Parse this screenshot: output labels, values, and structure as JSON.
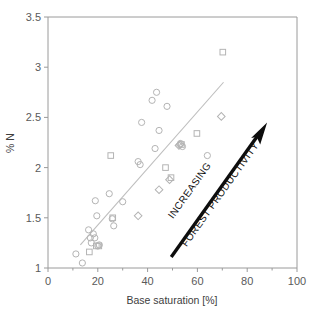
{
  "chart_data": {
    "type": "scatter",
    "title": "",
    "xlabel": "Base saturation [%]",
    "ylabel": "% N",
    "xlim": [
      0,
      100
    ],
    "ylim": [
      1,
      3.5
    ],
    "xticks": [
      0,
      20,
      40,
      60,
      80,
      100
    ],
    "xtick_labels": [
      "0",
      "20",
      "40",
      "60",
      "80",
      "100"
    ],
    "xminor_ticks": [
      10,
      30,
      50,
      70,
      90
    ],
    "yticks": [
      1,
      1.5,
      2,
      2.5,
      3,
      3.5
    ],
    "ytick_labels": [
      "1",
      "1.5",
      "2",
      "2.5",
      "3",
      "3.5"
    ],
    "grid": false,
    "legend": "none",
    "series": [
      {
        "name": "circles",
        "marker": "circle",
        "color": "#b4b4b4",
        "points": [
          [
            11.2,
            1.14
          ],
          [
            13.8,
            1.05
          ],
          [
            16.3,
            1.38
          ],
          [
            17.0,
            1.3
          ],
          [
            17.4,
            1.25
          ],
          [
            18.2,
            1.34
          ],
          [
            18.8,
            1.3
          ],
          [
            19.0,
            1.67
          ],
          [
            19.6,
            1.52
          ],
          [
            20.0,
            1.22
          ],
          [
            20.6,
            1.23
          ],
          [
            24.6,
            1.74
          ],
          [
            25.8,
            1.49
          ],
          [
            26.4,
            1.42
          ],
          [
            30.0,
            1.66
          ],
          [
            36.2,
            2.06
          ],
          [
            37.0,
            2.03
          ],
          [
            37.6,
            2.45
          ],
          [
            41.8,
            2.67
          ],
          [
            43.0,
            2.19
          ],
          [
            43.6,
            2.75
          ],
          [
            44.6,
            2.37
          ],
          [
            47.8,
            2.61
          ],
          [
            53.2,
            2.24
          ],
          [
            54.0,
            2.21
          ],
          [
            64.0,
            2.12
          ]
        ]
      },
      {
        "name": "squares",
        "marker": "square",
        "color": "#b4b4b4",
        "points": [
          [
            16.6,
            1.16
          ],
          [
            19.4,
            1.22
          ],
          [
            20.4,
            1.22
          ],
          [
            25.2,
            2.12
          ],
          [
            26.0,
            1.5
          ],
          [
            47.2,
            2.0
          ],
          [
            49.4,
            1.9
          ],
          [
            53.6,
            2.23
          ],
          [
            59.8,
            2.34
          ],
          [
            70.2,
            3.15
          ]
        ]
      },
      {
        "name": "diamonds",
        "marker": "diamond",
        "color": "#b4b4b4",
        "points": [
          [
            36.2,
            1.52
          ],
          [
            44.6,
            1.78
          ],
          [
            48.8,
            1.88
          ],
          [
            52.6,
            2.22
          ],
          [
            53.0,
            2.23
          ],
          [
            69.6,
            2.51
          ]
        ]
      }
    ],
    "trendline": {
      "name": "regression-line",
      "x": [
        13.0,
        70.5
      ],
      "y": [
        1.23,
        2.85
      ],
      "color": "#bdbdbd"
    },
    "annotations": [
      {
        "name": "productivity-arrow",
        "type": "arrow",
        "from_data": [
          49.5,
          1.11
        ],
        "to_data": [
          88.0,
          2.45
        ],
        "color": "#0d0d0d"
      },
      {
        "name": "increasing-label",
        "type": "text",
        "text": "INCREASING",
        "rotation": -49
      },
      {
        "name": "forest-productivity-label",
        "type": "text",
        "text": "FOREST PRODUCTIVITY",
        "rotation": -49
      }
    ]
  },
  "axes": {
    "x_title": "Base saturation [%]",
    "y_title": "% N",
    "x_labels": [
      "0",
      "20",
      "40",
      "60",
      "80",
      "100"
    ],
    "y_labels": [
      "1",
      "1.5",
      "2",
      "2.5",
      "3",
      "3.5"
    ]
  },
  "annotation_text": {
    "increasing": "INCREASING",
    "forest_productivity": "FOREST PRODUCTIVITY"
  },
  "colors": {
    "marker_stroke": "#b4b4b4",
    "trendline": "#bdbdbd",
    "axis": "#9a9a9a",
    "arrow": "#0d0d0d",
    "tick_text": "#5a5a5a",
    "background": "#ffffff"
  }
}
